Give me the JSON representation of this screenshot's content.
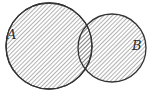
{
  "diagram": {
    "type": "venn",
    "sets": [
      {
        "label": "A",
        "cx": 49,
        "cy": 46,
        "r": 43,
        "shaded": true
      },
      {
        "label": "B",
        "cx": 112,
        "cy": 48,
        "r": 34,
        "shaded": true
      }
    ],
    "shading": "diagonal-hatch",
    "colors": {
      "stroke": "#333333",
      "hatch": "#555555",
      "background": "#ffffff"
    }
  }
}
